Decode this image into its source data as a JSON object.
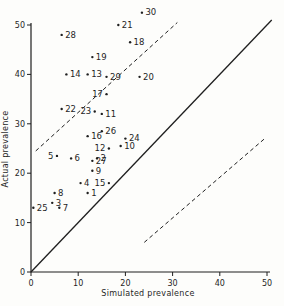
{
  "figure": {
    "background": "#fdfdfb",
    "ink": "#1f1f1f"
  },
  "chart_data": {
    "type": "scatter",
    "title": "",
    "xlabel": "Simulated prevalence",
    "ylabel": "Actual prevalence",
    "xlim": [
      0,
      50
    ],
    "ylim": [
      0,
      50
    ],
    "xticks": [
      0,
      10,
      20,
      30,
      40,
      50
    ],
    "yticks": [
      0,
      10,
      20,
      30,
      40,
      50
    ],
    "grid": false,
    "legend": false,
    "points": [
      {
        "id": 1,
        "x": 12,
        "y": 16,
        "side": "right"
      },
      {
        "id": 2,
        "x": 14,
        "y": 23,
        "side": "right"
      },
      {
        "id": 3,
        "x": 4.5,
        "y": 14,
        "side": "right"
      },
      {
        "id": 4,
        "x": 10.5,
        "y": 18,
        "side": "right"
      },
      {
        "id": 5,
        "x": 5.5,
        "y": 23.5,
        "side": "left"
      },
      {
        "id": 6,
        "x": 8.5,
        "y": 23,
        "side": "right"
      },
      {
        "id": 7,
        "x": 6,
        "y": 13,
        "side": "right"
      },
      {
        "id": 8,
        "x": 5,
        "y": 16,
        "side": "right"
      },
      {
        "id": 9,
        "x": 13,
        "y": 20.5,
        "side": "right"
      },
      {
        "id": 10,
        "x": 19,
        "y": 25.5,
        "side": "right"
      },
      {
        "id": 11,
        "x": 15,
        "y": 32,
        "side": "right"
      },
      {
        "id": 12,
        "x": 16.5,
        "y": 25,
        "side": "left"
      },
      {
        "id": 13,
        "x": 12,
        "y": 40,
        "side": "right"
      },
      {
        "id": 14,
        "x": 7.5,
        "y": 40,
        "side": "right"
      },
      {
        "id": 15,
        "x": 16.5,
        "y": 18,
        "side": "left"
      },
      {
        "id": 16,
        "x": 12,
        "y": 27.5,
        "side": "right"
      },
      {
        "id": 17,
        "x": 16,
        "y": 36,
        "side": "left"
      },
      {
        "id": 18,
        "x": 21,
        "y": 46.5,
        "side": "right"
      },
      {
        "id": 19,
        "x": 13,
        "y": 43.5,
        "side": "right"
      },
      {
        "id": 20,
        "x": 23,
        "y": 39.5,
        "side": "right"
      },
      {
        "id": 21,
        "x": 18.5,
        "y": 50,
        "side": "right"
      },
      {
        "id": 22,
        "x": 6.5,
        "y": 33,
        "side": "right"
      },
      {
        "id": 23,
        "x": 13.5,
        "y": 32.5,
        "side": "left"
      },
      {
        "id": 24,
        "x": 20,
        "y": 27,
        "side": "right"
      },
      {
        "id": 25,
        "x": 0.5,
        "y": 13,
        "side": "right"
      },
      {
        "id": 26,
        "x": 15,
        "y": 28.5,
        "side": "right"
      },
      {
        "id": 27,
        "x": 13,
        "y": 22.5,
        "side": "right"
      },
      {
        "id": 28,
        "x": 6.5,
        "y": 48,
        "side": "right"
      },
      {
        "id": 29,
        "x": 16,
        "y": 39.5,
        "side": "right"
      },
      {
        "id": 30,
        "x": 23.5,
        "y": 52.5,
        "side": "right"
      }
    ],
    "lines": [
      {
        "name": "identity-line",
        "style": "solid",
        "from": [
          0,
          0
        ],
        "to": [
          51,
          51
        ]
      },
      {
        "name": "upper-band-dashed-line",
        "style": "dashed",
        "from": [
          1,
          24.5
        ],
        "to": [
          31,
          50.5
        ]
      },
      {
        "name": "lower-band-dashed-line",
        "style": "dashed",
        "from": [
          24,
          6
        ],
        "to": [
          49.5,
          27
        ]
      }
    ]
  }
}
